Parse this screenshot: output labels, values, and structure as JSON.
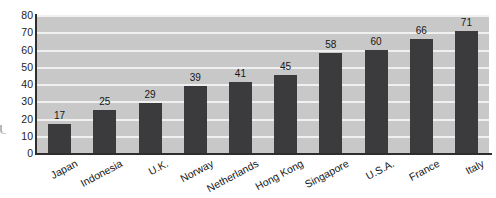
{
  "chart_data": {
    "type": "bar",
    "categories": [
      "Japan",
      "Indonesia",
      "U.K.",
      "Norway",
      "Netherlands",
      "Hong Kong",
      "Singapore",
      "U.S.A.",
      "France",
      "Italy"
    ],
    "values": [
      17,
      25,
      29,
      39,
      41,
      45,
      58,
      60,
      66,
      71
    ],
    "value_labels": [
      "17",
      "25",
      "29",
      "39",
      "41",
      "45",
      "58",
      "60",
      "66",
      "71"
    ],
    "title": "",
    "xlabel": "",
    "ylabel": "",
    "ylim": [
      0,
      80
    ],
    "ytick_step": 10,
    "ytick_labels": [
      "0",
      "10",
      "20",
      "30",
      "40",
      "50",
      "60",
      "70",
      "80"
    ],
    "grid": true,
    "legend": null,
    "colors": {
      "bar": "#3b3b3d",
      "plot_background": "#c8c8c8",
      "gridline": "#f0f0f0",
      "axis": "#2e2e2e",
      "text": "#161616",
      "page_background": "#ffffff"
    }
  }
}
